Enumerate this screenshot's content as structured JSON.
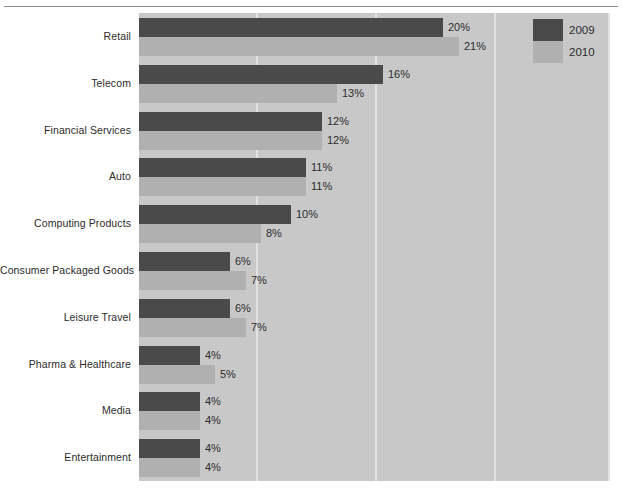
{
  "chart_data": {
    "type": "bar",
    "orientation": "horizontal",
    "title": "",
    "xlabel": "",
    "ylabel": "",
    "grid": true,
    "legend_position": "top-right",
    "value_suffix": "%",
    "xlim": [
      0,
      31
    ],
    "gridline_values": [
      7.7,
      15.5,
      23.3
    ],
    "categories": [
      "Retail",
      "Telecom",
      "Financial Services",
      "Auto",
      "Computing Products",
      "Consumer Packaged Goods",
      "Leisure Travel",
      "Pharma & Healthcare",
      "Media",
      "Entertainment"
    ],
    "series": [
      {
        "name": "2009",
        "color": "#4a4a4a",
        "values": [
          20,
          16,
          12,
          11,
          10,
          6,
          6,
          4,
          4,
          4
        ],
        "labels": [
          "20%",
          "16%",
          "12%",
          "11%",
          "10%",
          "6%",
          "6%",
          "4%",
          "4%",
          "4%"
        ]
      },
      {
        "name": "2010",
        "color": "#b0b0b0",
        "values": [
          21,
          13,
          12,
          11,
          8,
          7,
          7,
          5,
          4,
          4
        ],
        "labels": [
          "21%",
          "13%",
          "12%",
          "11%",
          "8%",
          "7%",
          "7%",
          "5%",
          "4%",
          "4%"
        ]
      }
    ]
  },
  "legend": {
    "items": [
      {
        "label": "2009",
        "color": "#4a4a4a"
      },
      {
        "label": "2010",
        "color": "#b0b0b0"
      }
    ]
  },
  "colors": {
    "plot_background": "#c8c8c8",
    "page_background": "#ffffff",
    "gridline": "#e2e2e2",
    "series_2009": "#4a4a4a",
    "series_2010": "#b0b0b0",
    "text": "#2b2b2b",
    "rule": "#8e8e8e"
  }
}
